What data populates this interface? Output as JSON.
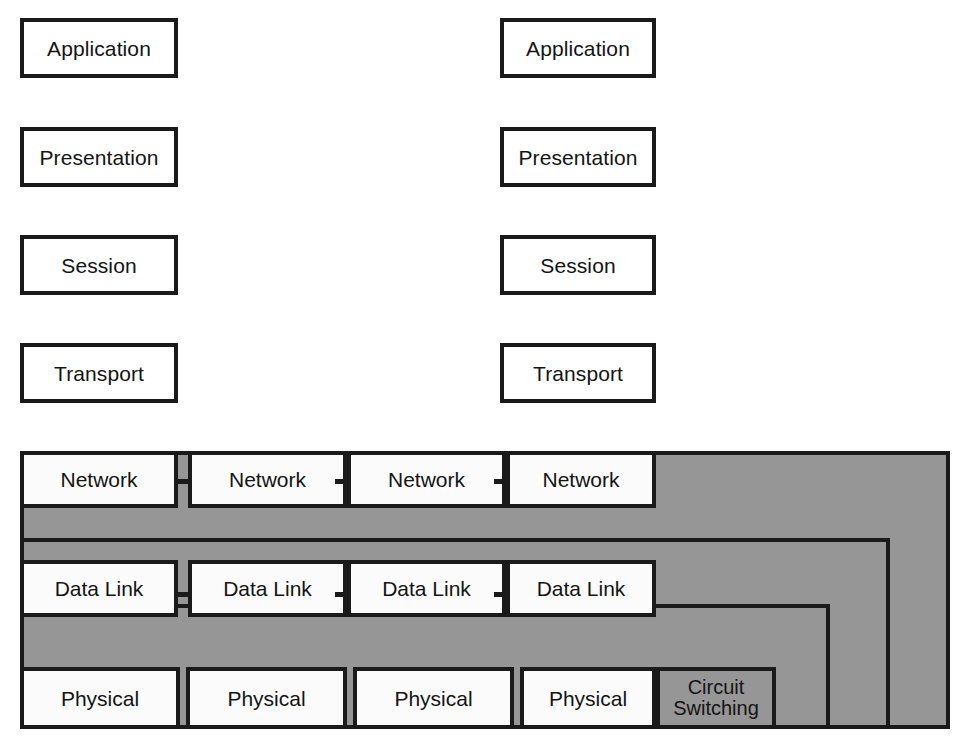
{
  "diagram": {
    "colors": {
      "gray_fill": "#969696",
      "stroke": "#1a1a1a",
      "box_fill": "#ffffff",
      "background": "#ffffff"
    }
  },
  "left_stack": {
    "name": "End system protocol stack (left)",
    "layers": [
      {
        "label": "Application"
      },
      {
        "label": "Presentation"
      },
      {
        "label": "Session"
      },
      {
        "label": "Transport"
      }
    ]
  },
  "right_stack": {
    "name": "End system protocol stack (right)",
    "layers": [
      {
        "label": "Application"
      },
      {
        "label": "Presentation"
      },
      {
        "label": "Session"
      },
      {
        "label": "Transport"
      }
    ]
  },
  "network_row": {
    "layer_name": "Network",
    "nodes": [
      {
        "label": "Network"
      },
      {
        "label": "Network"
      },
      {
        "label": "Network"
      },
      {
        "label": "Network"
      }
    ]
  },
  "datalink_row": {
    "layer_name": "Data Link",
    "nodes": [
      {
        "label": "Data Link"
      },
      {
        "label": "Data Link"
      },
      {
        "label": "Data Link"
      },
      {
        "label": "Data Link"
      }
    ]
  },
  "physical_row": {
    "layer_name": "Physical",
    "nodes": [
      {
        "label": "Physical"
      },
      {
        "label": "Physical"
      },
      {
        "label": "Physical"
      },
      {
        "label": "Physical"
      }
    ]
  },
  "switching_regions": [
    {
      "id": "packet",
      "label": "Packet Switching",
      "spans_layers": "Network down to Physical"
    },
    {
      "id": "frame",
      "label": "Frame Switching",
      "spans_layers": "Data Link down to Physical"
    },
    {
      "id": "cell",
      "label": "Cell Switching",
      "spans_layers": "Data Link down to Physical"
    },
    {
      "id": "circuit",
      "label": "Circuit Switching",
      "spans_layers": "Physical"
    }
  ],
  "circuit_switching": {
    "line1": "Circuit",
    "line2": "Switching"
  }
}
